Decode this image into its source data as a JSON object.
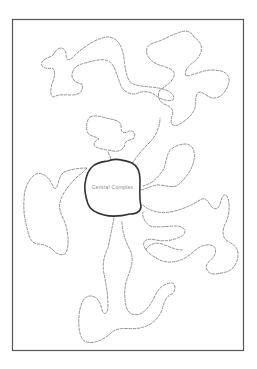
{
  "diagram": {
    "title": "",
    "center_label": "Central Complex",
    "colors": {
      "background": "#ffffff",
      "frame": "#555555",
      "dashed_lines": "#777777",
      "core_outline": "#333333",
      "label": "#8a8a8a"
    },
    "elements": {
      "frame": "rectangular border",
      "core": "solid outlined rounded blob, labeled",
      "dashed_regions_count": 9
    }
  }
}
